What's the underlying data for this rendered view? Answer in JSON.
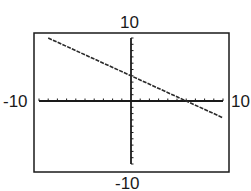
{
  "chart_data": {
    "type": "line",
    "title": "",
    "xlabel": "",
    "ylabel": "",
    "xlim": [
      -10,
      10
    ],
    "ylim": [
      -10,
      10
    ],
    "grid": false,
    "tick_labels": {
      "top": "10",
      "bottom": "-10",
      "left": "-10",
      "right": "10"
    },
    "series": [
      {
        "name": "line",
        "equation": "y = -2/3 x + 4",
        "x": [
          -9,
          0,
          6,
          10
        ],
        "y": [
          10,
          4,
          0,
          -2.67
        ]
      }
    ],
    "y_intercept": 4,
    "x_intercept": 6,
    "tick_spacing": 1
  },
  "colors": {
    "axis": "#1a1a1a",
    "line": "#2a2a2a",
    "frame": "#1a1a1a"
  }
}
